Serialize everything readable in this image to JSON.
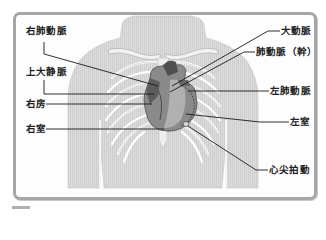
{
  "diagram": {
    "labels_left": [
      {
        "id": "right-pulmonary-artery",
        "text": "右肺動脈"
      },
      {
        "id": "superior-vena-cava",
        "text": "上大静脈"
      },
      {
        "id": "right-atrium",
        "text": "右房"
      },
      {
        "id": "right-ventricle",
        "text": "右室"
      }
    ],
    "labels_right": [
      {
        "id": "aorta",
        "text": "大動脈"
      },
      {
        "id": "pulmonary-trunk",
        "text": "肺動脈（幹）"
      },
      {
        "id": "left-pulmonary-artery",
        "text": "左肺動脈"
      },
      {
        "id": "left-ventricle",
        "text": "左室"
      },
      {
        "id": "apex-beat",
        "text": "心尖拍動"
      }
    ],
    "colors": {
      "frame_border": "#a6a6a6",
      "body_fill": "#d9d9d9",
      "rib_stroke": "#ffffff",
      "heart_dark": "#555555",
      "heart_mid": "#8a8a8a",
      "heart_light": "#b5b5b5",
      "leader_line": "#1a1a1a"
    }
  }
}
